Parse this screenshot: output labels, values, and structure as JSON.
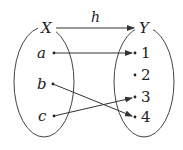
{
  "diagram": {
    "function_name": "h",
    "domain_set": {
      "name": "X",
      "elements": [
        "a",
        "b",
        "c"
      ]
    },
    "codomain_set": {
      "name": "Y",
      "elements": [
        "1",
        "2",
        "3",
        "4"
      ]
    },
    "mappings": [
      {
        "from": "a",
        "to": "1"
      },
      {
        "from": "b",
        "to": "4"
      },
      {
        "from": "c",
        "to": "3"
      }
    ],
    "colors": {
      "stroke": "#333333",
      "text": "#222222"
    }
  }
}
